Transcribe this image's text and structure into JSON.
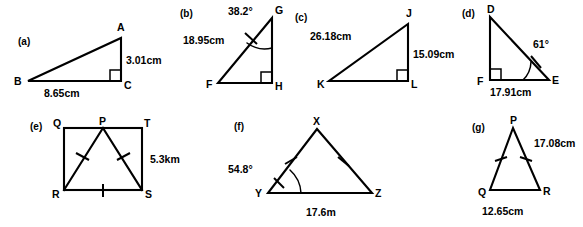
{
  "page": {
    "background_color": "#ffffff",
    "ink_color": "#000000"
  },
  "figures": [
    {
      "key": "a",
      "label": "(a)",
      "shape": "right-triangle",
      "vertices": [
        "A",
        "B",
        "C"
      ],
      "right_angle_at": "C",
      "measures": [
        {
          "name": "AC",
          "value": "3.01cm"
        },
        {
          "name": "BC",
          "value": "8.65cm"
        }
      ],
      "angles": [],
      "tick_marks": []
    },
    {
      "key": "b",
      "label": "(b)",
      "shape": "right-triangle",
      "vertices": [
        "G",
        "F",
        "H"
      ],
      "right_angle_at": "H",
      "measures": [
        {
          "name": "FG",
          "value": "18.95cm"
        }
      ],
      "angles": [
        {
          "at": "G",
          "value": "38.2°"
        }
      ],
      "tick_marks": [
        "FG"
      ]
    },
    {
      "key": "c",
      "label": "(c)",
      "shape": "right-triangle",
      "vertices": [
        "J",
        "K",
        "L"
      ],
      "right_angle_at": "L",
      "measures": [
        {
          "name": "KJ",
          "value": "26.18cm"
        },
        {
          "name": "JL",
          "value": "15.09cm"
        }
      ],
      "angles": [],
      "tick_marks": []
    },
    {
      "key": "d",
      "label": "(d)",
      "shape": "right-triangle",
      "vertices": [
        "D",
        "F",
        "E"
      ],
      "right_angle_at": "F",
      "measures": [
        {
          "name": "FE",
          "value": "17.91cm"
        }
      ],
      "angles": [
        {
          "at": "E",
          "value": "61°"
        }
      ],
      "tick_marks": [
        "DE"
      ]
    },
    {
      "key": "e",
      "label": "(e)",
      "shape": "square-with-inscribed-triangle",
      "vertices": [
        "Q",
        "P",
        "T",
        "R",
        "S"
      ],
      "right_angle_at": "",
      "measures": [
        {
          "name": "TS",
          "value": "5.3km"
        }
      ],
      "angles": [],
      "tick_marks": [
        "PR",
        "PS",
        "RS"
      ]
    },
    {
      "key": "f",
      "label": "(f)",
      "shape": "isosceles-triangle",
      "vertices": [
        "X",
        "Y",
        "Z"
      ],
      "right_angle_at": "",
      "measures": [
        {
          "name": "YZ",
          "value": "17.6m"
        }
      ],
      "angles": [
        {
          "at": "Y",
          "value": "54.8°"
        }
      ],
      "tick_marks": [
        "XY",
        "XZ"
      ]
    },
    {
      "key": "g",
      "label": "(g)",
      "shape": "isosceles-triangle",
      "vertices": [
        "P",
        "Q",
        "R"
      ],
      "right_angle_at": "",
      "measures": [
        {
          "name": "PR",
          "value": "17.08cm"
        },
        {
          "name": "QR",
          "value": "12.65cm"
        }
      ],
      "angles": [],
      "tick_marks": [
        "PQ",
        "PR"
      ]
    }
  ]
}
